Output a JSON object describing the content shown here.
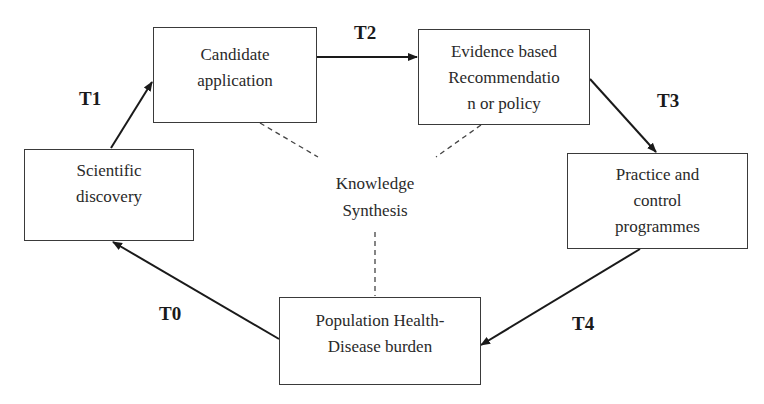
{
  "diagram": {
    "nodes": [
      {
        "id": "candidate",
        "lines": [
          "Candidate",
          "application"
        ]
      },
      {
        "id": "evidence",
        "lines": [
          "Evidence based",
          "Recommendatio",
          "n or policy"
        ]
      },
      {
        "id": "scientific",
        "lines": [
          "Scientific",
          "discovery"
        ]
      },
      {
        "id": "practice",
        "lines": [
          "Practice and",
          "control",
          "programmes"
        ]
      },
      {
        "id": "population",
        "lines": [
          "Population Health-",
          "Disease burden"
        ]
      }
    ],
    "center": {
      "lines": [
        "Knowledge",
        "Synthesis"
      ]
    },
    "edges": [
      {
        "label": "T0",
        "from": "population",
        "to": "scientific"
      },
      {
        "label": "T1",
        "from": "scientific",
        "to": "candidate"
      },
      {
        "label": "T2",
        "from": "candidate",
        "to": "evidence"
      },
      {
        "label": "T3",
        "from": "evidence",
        "to": "practice"
      },
      {
        "label": "T4",
        "from": "practice",
        "to": "population"
      }
    ],
    "dashed_links": [
      "candidate",
      "evidence",
      "population"
    ]
  }
}
